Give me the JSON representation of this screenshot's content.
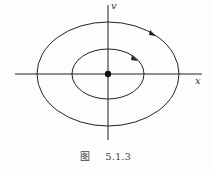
{
  "figure": {
    "caption_prefix": "图",
    "caption_number": "5.1.3",
    "axes": {
      "x_label": "x",
      "y_label": "v"
    },
    "origin": {
      "type": "center-equilibrium",
      "marker": "filled-dot"
    },
    "orbits": [
      {
        "name": "outer",
        "shape": "ellipse",
        "direction": "clockwise"
      },
      {
        "name": "inner",
        "shape": "ellipse",
        "direction": "clockwise"
      }
    ],
    "colors": {
      "line": "#222222",
      "background": "#fdfdfd"
    }
  }
}
